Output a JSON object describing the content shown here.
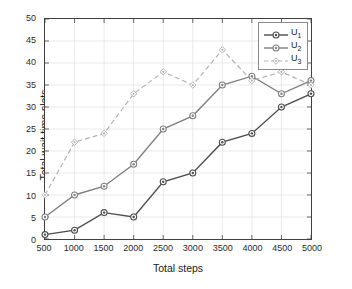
{
  "chart_data": {
    "type": "line",
    "title": "",
    "xlabel": "Total steps",
    "ylabel": "Total wait time slots",
    "x": [
      500,
      1000,
      1500,
      2000,
      2500,
      3000,
      3500,
      4000,
      4500,
      5000
    ],
    "xtick_labels": [
      "500",
      "1000",
      "1500",
      "2000",
      "2500",
      "3000",
      "3500",
      "4000",
      "4500",
      "5000"
    ],
    "ytick_labels": [
      "0",
      "5",
      "10",
      "15",
      "20",
      "25",
      "30",
      "35",
      "40",
      "45",
      "50"
    ],
    "xlim": [
      500,
      5000
    ],
    "ylim": [
      0,
      50
    ],
    "grid": true,
    "legend_position": "top-right",
    "series": [
      {
        "name": "U1",
        "label": "U",
        "subscript": "1",
        "values": [
          1,
          2,
          6,
          5,
          13,
          15,
          22,
          24,
          30,
          33
        ],
        "color": "#4d4d4d",
        "style": "solid",
        "marker": "circle"
      },
      {
        "name": "U2",
        "label": "U",
        "subscript": "2",
        "values": [
          5,
          10,
          12,
          17,
          25,
          28,
          35,
          37,
          33,
          36
        ],
        "color": "#808080",
        "style": "solid",
        "marker": "circle"
      },
      {
        "name": "U3",
        "label": "U",
        "subscript": "3",
        "values": [
          10,
          22,
          24,
          33,
          38,
          35,
          43,
          36,
          38,
          35
        ],
        "color": "#b3b3b3",
        "style": "dashed",
        "marker": "diamond"
      }
    ]
  },
  "axes": {
    "frame_color": "#404040",
    "grid_color": "#e0e0e0",
    "tick_color": "#2b2b2b"
  }
}
